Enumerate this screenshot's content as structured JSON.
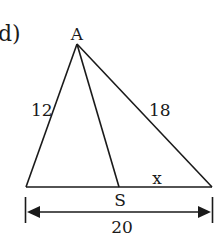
{
  "figure": {
    "part_label": "d)",
    "vertices": {
      "apex": "A",
      "foot": "S"
    },
    "side_labels": {
      "left_side": "12",
      "right_side": "18",
      "segment_right": "x",
      "base_total": "20"
    },
    "colors": {
      "stroke": "#1a1a1a",
      "background": "#ffffff"
    }
  }
}
